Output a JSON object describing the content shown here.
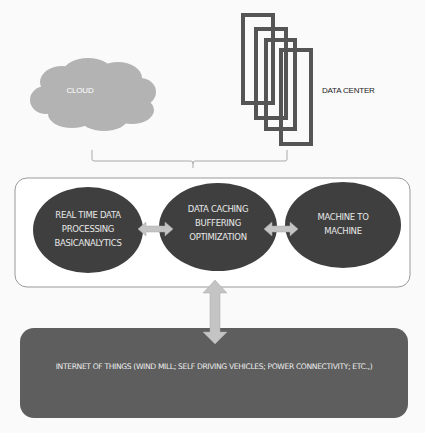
{
  "diagram": {
    "cloud": {
      "label": "CLOUD",
      "fill": "#b3b3b3"
    },
    "data_center": {
      "label": "DATA CENTER",
      "stroke": "#555555",
      "rect_count": 4
    },
    "edge_layer": {
      "nodes": [
        {
          "id": "realtime",
          "lines": [
            "REAL TIME DATA",
            "PROCESSING",
            "BASICANALYTICS"
          ]
        },
        {
          "id": "caching",
          "lines": [
            "DATA CACHING",
            "BUFFERING",
            "OPTIMIZATION"
          ]
        },
        {
          "id": "m2m",
          "lines": [
            "MACHINE TO",
            "MACHINE"
          ]
        }
      ],
      "node_fill": "#3f3f3f",
      "arrow_fill": "#c4c4c4"
    },
    "iot": {
      "label": "INTERNET OF THINGS (WIND MILL; SELF DRIVING VEHICLES; POWER CONNECTIVITY; ETC.,)",
      "fill": "#5e5e5e"
    }
  }
}
